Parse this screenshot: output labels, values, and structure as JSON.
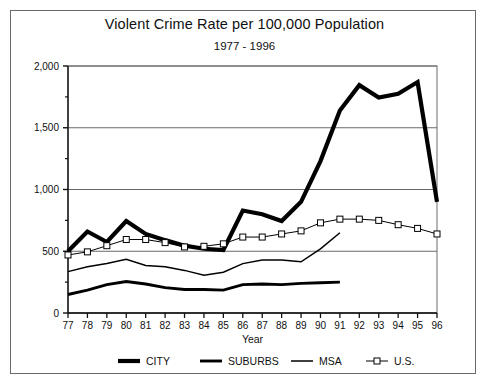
{
  "chart_data": {
    "type": "line",
    "title": "Violent Crime Rate per 100,000 Population",
    "subtitle": "1977 - 1996",
    "xlabel": "Year",
    "ylabel": "",
    "grid": true,
    "legend_position": "bottom",
    "xlim": [
      77,
      96
    ],
    "ylim": [
      0,
      2000
    ],
    "ytick_labels": [
      "0",
      "500",
      "1,000",
      "1,500",
      "2,000"
    ],
    "ytick_values": [
      0,
      500,
      1000,
      1500,
      2000
    ],
    "yminor_values": [
      250,
      750,
      1250,
      1750
    ],
    "categories": [
      "77",
      "78",
      "79",
      "80",
      "81",
      "82",
      "83",
      "84",
      "85",
      "86",
      "87",
      "88",
      "89",
      "90",
      "91",
      "92",
      "93",
      "94",
      "95",
      "96"
    ],
    "x": [
      1977,
      1978,
      1979,
      1980,
      1981,
      1982,
      1983,
      1984,
      1985,
      1986,
      1987,
      1988,
      1989,
      1990,
      1991,
      1992,
      1993,
      1994,
      1995,
      1996
    ],
    "series": [
      {
        "name": "CITY",
        "style": "thick-solid",
        "marker": "none",
        "color": "#000000",
        "width": 4.2,
        "values": [
          500,
          660,
          575,
          745,
          640,
          590,
          545,
          520,
          510,
          830,
          800,
          745,
          900,
          1230,
          1640,
          1845,
          1745,
          1775,
          1870,
          900
        ]
      },
      {
        "name": "SUBURBS",
        "style": "medium-solid",
        "marker": "none",
        "color": "#000000",
        "width": 2.9,
        "values": [
          150,
          185,
          230,
          255,
          235,
          205,
          190,
          190,
          185,
          230,
          235,
          230,
          240,
          245,
          250,
          null,
          null,
          null,
          null,
          null
        ]
      },
      {
        "name": "MSA",
        "style": "thin-solid",
        "marker": "none",
        "color": "#000000",
        "width": 1.5,
        "values": [
          335,
          375,
          400,
          435,
          385,
          375,
          345,
          305,
          330,
          400,
          430,
          430,
          415,
          520,
          650,
          null,
          null,
          null,
          null,
          null
        ]
      },
      {
        "name": "U.S.",
        "style": "thin-marker",
        "marker": "square",
        "color": "#000000",
        "width": 1.0,
        "values": [
          470,
          495,
          545,
          595,
          595,
          570,
          535,
          540,
          560,
          615,
          615,
          640,
          665,
          730,
          760,
          760,
          750,
          715,
          685,
          640
        ]
      }
    ]
  },
  "legend": {
    "items": [
      {
        "label": "CITY"
      },
      {
        "label": "SUBURBS"
      },
      {
        "label": "MSA"
      },
      {
        "label": "U.S."
      }
    ]
  }
}
